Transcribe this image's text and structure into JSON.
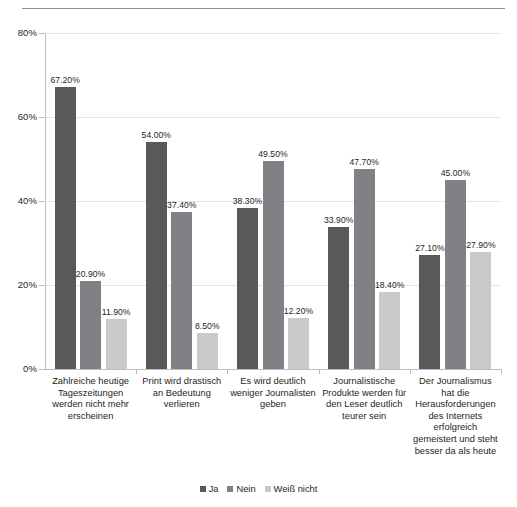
{
  "chart_data": {
    "type": "bar",
    "title": "",
    "subtitle": "",
    "xlabel": "",
    "ylabel": "",
    "ylim": [
      0,
      80
    ],
    "grid": true,
    "legend_position": "bottom",
    "ytick_labels": [
      "0%",
      "20%",
      "40%",
      "60%",
      "80%"
    ],
    "ytick_values": [
      0,
      20,
      40,
      60,
      80
    ],
    "categories": [
      "Zahlreiche heutige Tageszeitungen werden nicht mehr erscheinen",
      "Print wird drastisch an Bedeutung verlieren",
      "Es wird deutlich weniger Journalisten geben",
      "Journalistische Produkte werden für den Leser deutlich teurer sein",
      "Der Journalismus hat die Herausforderungen des Internets erfolgreich gemeistert und steht besser da als heute"
    ],
    "series": [
      {
        "name": "Ja",
        "color": "#58595b",
        "values": [
          67.2,
          54.0,
          38.3,
          33.9,
          27.1
        ],
        "labels": [
          "67.20%",
          "54.00%",
          "38.30%",
          "33.90%",
          "27.10%"
        ]
      },
      {
        "name": "Nein",
        "color": "#808184",
        "values": [
          20.9,
          37.4,
          49.5,
          47.7,
          45.0
        ],
        "labels": [
          "20.90%",
          "37.40%",
          "49.50%",
          "47.70%",
          "45.00%"
        ]
      },
      {
        "name": "Weiß nicht",
        "color": "#c9cacc",
        "values": [
          11.9,
          8.5,
          12.2,
          18.4,
          27.9
        ],
        "labels": [
          "11.90%",
          "8.50%",
          "12.20%",
          "18.40%",
          "27.90%"
        ]
      }
    ]
  },
  "legend": {
    "items": [
      {
        "label": "Ja"
      },
      {
        "label": "Nein"
      },
      {
        "label": "Weiß nicht"
      }
    ]
  }
}
